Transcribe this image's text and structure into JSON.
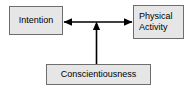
{
  "diagram": {
    "background_color": "#ffffff",
    "node_fill_color": "#e6e6e6",
    "node_border_color": "#6e6e6e",
    "edge_color": "#000000",
    "nodes": [
      {
        "id": "intention",
        "label": "Intention",
        "x": 9,
        "y": 6,
        "width": 54,
        "height": 29
      },
      {
        "id": "physical_activity",
        "label": "Physical\nActivity",
        "x": 133,
        "y": 5,
        "width": 51,
        "height": 34
      },
      {
        "id": "conscientiousness",
        "label": "Conscientiousness",
        "x": 46,
        "y": 64,
        "width": 105,
        "height": 21
      }
    ],
    "edges": [
      {
        "id": "intention-physical-activity",
        "from": "intention",
        "to": "physical_activity",
        "direction": "bidirectional",
        "orientation": "horizontal"
      },
      {
        "id": "conscientiousness-link",
        "from": "conscientiousness",
        "to": "intention-physical-activity",
        "direction": "up",
        "orientation": "vertical"
      }
    ]
  }
}
